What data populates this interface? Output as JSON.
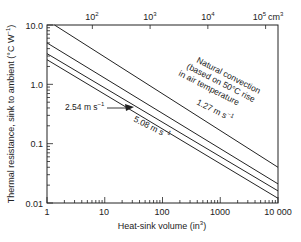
{
  "chart_data": {
    "type": "line",
    "title": "",
    "xlabel": "Heat-sink volume (in³)",
    "ylabel": "Thermal resistance, sink to ambient (°C W⁻¹)",
    "xscale": "log",
    "yscale": "log",
    "xlim": [
      1,
      10000
    ],
    "ylim": [
      0.01,
      10.0
    ],
    "x_ticks": [
      "1",
      "10",
      "100",
      "1000",
      "10 000"
    ],
    "y_ticks": [
      "10.0",
      "1.0",
      "0.1",
      "0.01"
    ],
    "secondary_x_axis": {
      "unit": "cm³",
      "ticks": [
        "10²",
        "10³",
        "10⁴",
        "10⁵ cm³"
      ],
      "tick_values_in3": [
        6.1,
        61,
        610,
        6100
      ]
    },
    "grid": false,
    "series": [
      {
        "name": "Natural convection (based on 50°C rise in air temperature)",
        "x": [
          1.35,
          10000
        ],
        "y": [
          10.0,
          0.04
        ]
      },
      {
        "name": "1.27 m s⁻¹",
        "x": [
          1,
          10000
        ],
        "y": [
          5.0,
          0.021
        ]
      },
      {
        "name": "2.54 m s⁻¹",
        "x": [
          1,
          10000
        ],
        "y": [
          3.3,
          0.016
        ]
      },
      {
        "name": "5.08 m s⁻¹",
        "x": [
          1,
          10000
        ],
        "y": [
          2.6,
          0.012
        ]
      }
    ],
    "annotations": [
      "Natural convection",
      "(based on 50°C rise",
      "in air temperature",
      "1.27 m s⁻¹",
      "2.54 m s⁻¹",
      "5.08 m s⁻¹"
    ]
  },
  "labels": {
    "xlabel": "Heat-sink volume (in",
    "xlabel_sup": "3",
    "xlabel_end": ")",
    "ylabel": "Thermal resistance, sink to ambient (°C W",
    "ylabel_sup": "−1",
    "ylabel_end": ")",
    "x_ticks": [
      "1",
      "10",
      "100",
      "1000",
      "10 000"
    ],
    "y_ticks": [
      "10.0",
      "1.0",
      "0.1",
      "0.01"
    ],
    "top_ticks": [
      {
        "base": "10",
        "exp": "2"
      },
      {
        "base": "10",
        "exp": "3"
      },
      {
        "base": "10",
        "exp": "4"
      },
      {
        "base": "10",
        "exp": "5"
      }
    ],
    "top_unit": "cm",
    "top_unit_sup": "3",
    "nat1": "Natural convection",
    "nat2": "(based on 50°C rise",
    "nat3": "in air temperature",
    "s127": "1.27 m s",
    "s254": "2.54 m s",
    "s508": "5.08 m s",
    "inv": "−1"
  }
}
